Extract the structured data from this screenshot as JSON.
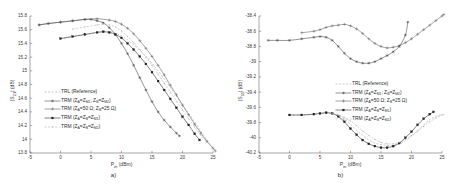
{
  "figure": {
    "panels": [
      {
        "caption": "a)",
        "ylabel": "|S21| (dB)",
        "xlabel": "Pin (dBm)"
      },
      {
        "caption": "b)",
        "ylabel": "|S11| (dB)",
        "xlabel": "Pin (dBm)"
      }
    ],
    "legend_entries": [
      {
        "label": "TRL (Reference)",
        "marker": "none",
        "color": "#9a9a9a",
        "dash": "2,1.6"
      },
      {
        "label": "TRM (ZA=ZM1;  ZB=ZM2)",
        "marker": "star",
        "color": "#3c3c3c",
        "dash": "0"
      },
      {
        "label": "TRM (ZA=50 Ω; ZB=25 Ω)",
        "marker": "plus",
        "color": "#5a5a5a",
        "dash": "0"
      },
      {
        "label": "TRM (ZA=ZB=ZM1)",
        "marker": "square",
        "color": "#1e1e1e",
        "dash": "0"
      },
      {
        "label": "TRM (ZA=ZB=ZM2)",
        "marker": "dot",
        "color": "#aaaaaa",
        "dash": "2,1.6"
      }
    ]
  },
  "chart_data": [
    {
      "type": "line",
      "title": "",
      "xlabel": "Pin (dBm)",
      "ylabel": "|S21| (dB)",
      "xlim": [
        -5,
        25
      ],
      "ylim": [
        13.8,
        15.8
      ],
      "xticks": [
        -5,
        0,
        5,
        10,
        15,
        20,
        25
      ],
      "yticks": [
        13.8,
        14,
        14.2,
        14.4,
        14.6,
        14.8,
        15,
        15.2,
        15.4,
        15.6,
        15.8
      ],
      "grid": false,
      "legend_position": "center-left",
      "series": [
        {
          "name": "TRL (Reference)",
          "x": [
            0,
            2,
            4,
            6,
            8,
            9,
            10,
            11,
            12,
            13,
            14,
            15,
            16,
            17,
            18,
            19,
            20,
            21,
            22,
            23,
            24,
            25,
            25.4
          ],
          "y": [
            15.47,
            15.5,
            15.53,
            15.56,
            15.57,
            15.55,
            15.51,
            15.45,
            15.38,
            15.3,
            15.21,
            15.11,
            15.0,
            14.88,
            14.76,
            14.63,
            14.5,
            14.38,
            14.25,
            14.12,
            13.99,
            13.87,
            13.82
          ]
        },
        {
          "name": "TRM (ZA=ZM1;  ZB=ZM2)",
          "x": [
            -3.5,
            -2,
            0,
            2,
            4,
            5,
            6,
            7,
            8,
            9,
            10,
            11,
            12,
            13,
            14,
            15,
            16,
            17,
            18,
            19,
            19.5
          ],
          "y": [
            15.67,
            15.69,
            15.71,
            15.73,
            15.75,
            15.75,
            15.73,
            15.7,
            15.63,
            15.53,
            15.4,
            15.25,
            15.08,
            14.9,
            14.72,
            14.55,
            14.4,
            14.28,
            14.18,
            14.09,
            14.05
          ]
        },
        {
          "name": "TRM (ZA=50 Ω; ZB=25 Ω)",
          "x": [
            -3.5,
            -2,
            0,
            2,
            4,
            6,
            8,
            9,
            10,
            11,
            12,
            13,
            14,
            15,
            16,
            17,
            18,
            19,
            20,
            21,
            22,
            23,
            24,
            25,
            25.4
          ],
          "y": [
            15.67,
            15.69,
            15.71,
            15.73,
            15.75,
            15.76,
            15.74,
            15.72,
            15.68,
            15.62,
            15.54,
            15.44,
            15.33,
            15.21,
            15.08,
            14.94,
            14.79,
            14.65,
            14.5,
            14.36,
            14.22,
            14.09,
            13.97,
            13.87,
            13.83
          ]
        },
        {
          "name": "TRM (ZA=ZB=ZM1)",
          "x": [
            0,
            2,
            4,
            6,
            7,
            8,
            9,
            10,
            11,
            12,
            13,
            14,
            15,
            16,
            17,
            18,
            19,
            20,
            21,
            22,
            22.8
          ],
          "y": [
            15.47,
            15.5,
            15.53,
            15.56,
            15.57,
            15.56,
            15.53,
            15.48,
            15.4,
            15.31,
            15.21,
            15.1,
            14.98,
            14.85,
            14.72,
            14.59,
            14.46,
            14.33,
            14.21,
            14.08,
            13.99
          ]
        },
        {
          "name": "TRM (ZA=ZB=ZM2)",
          "x": [
            2,
            4,
            6,
            7,
            8,
            9,
            10,
            11,
            12,
            13,
            14,
            15,
            16,
            17,
            18,
            19,
            20,
            21,
            22,
            23,
            24,
            25,
            25.4
          ],
          "y": [
            15.61,
            15.64,
            15.67,
            15.68,
            15.67,
            15.64,
            15.58,
            15.5,
            15.41,
            15.31,
            15.2,
            15.08,
            14.95,
            14.82,
            14.69,
            14.56,
            14.43,
            14.3,
            14.18,
            14.06,
            13.96,
            13.87,
            13.83
          ]
        }
      ]
    },
    {
      "type": "line",
      "title": "",
      "xlabel": "Pin (dBm)",
      "ylabel": "|S11| (dB)",
      "xlim": [
        -5,
        25
      ],
      "ylim": [
        -40.2,
        -38.4
      ],
      "xticks": [
        -5,
        0,
        5,
        10,
        15,
        20,
        25
      ],
      "yticks": [
        -40.2,
        -40,
        -39.8,
        -39.6,
        -39.4,
        -39.2,
        -39,
        -38.8,
        -38.6,
        -38.4
      ],
      "grid": false,
      "legend_position": "center-right",
      "series": [
        {
          "name": "TRL (Reference)",
          "x": [
            0,
            2,
            4,
            6,
            7,
            8,
            9,
            10,
            11,
            12,
            13,
            14,
            15,
            16,
            17,
            18,
            19,
            20,
            21,
            22,
            23,
            24,
            25
          ],
          "y": [
            -39.7,
            -39.7,
            -39.69,
            -39.68,
            -39.68,
            -39.7,
            -39.75,
            -39.82,
            -39.9,
            -39.97,
            -40.03,
            -40.07,
            -40.09,
            -40.1,
            -40.1,
            -40.08,
            -40.04,
            -39.98,
            -39.91,
            -39.83,
            -39.76,
            -39.72,
            -39.7
          ]
        },
        {
          "name": "TRM (ZA=ZM1;  ZB=ZM2)",
          "x": [
            -3.5,
            -2,
            0,
            2,
            4,
            5,
            6,
            7,
            8,
            9,
            10,
            11,
            12,
            13,
            14,
            15,
            16,
            17,
            18,
            19,
            19.4
          ],
          "y": [
            -38.72,
            -38.72,
            -38.72,
            -38.7,
            -38.68,
            -38.67,
            -38.68,
            -38.72,
            -38.8,
            -38.89,
            -38.96,
            -39.0,
            -39.02,
            -39.02,
            -39.0,
            -38.96,
            -38.92,
            -38.87,
            -38.8,
            -38.65,
            -38.48
          ]
        },
        {
          "name": "TRM (ZA=50 Ω; ZB=25 Ω)",
          "x": [
            2,
            4,
            5,
            6,
            7,
            8,
            9,
            10,
            11,
            12,
            13,
            14,
            15,
            16,
            17,
            18,
            19,
            20,
            21,
            22,
            23,
            24,
            25,
            25.3
          ],
          "y": [
            -38.62,
            -38.6,
            -38.58,
            -38.55,
            -38.53,
            -38.52,
            -38.51,
            -38.53,
            -38.57,
            -38.63,
            -38.7,
            -38.76,
            -38.8,
            -38.82,
            -38.81,
            -38.79,
            -38.75,
            -38.7,
            -38.64,
            -38.58,
            -38.52,
            -38.46,
            -38.4,
            -38.38
          ]
        },
        {
          "name": "TRM (ZA=ZB=ZM1)",
          "x": [
            0,
            2,
            4,
            5,
            6,
            7,
            8,
            9,
            10,
            11,
            12,
            13,
            14,
            15,
            16,
            17,
            18,
            19,
            20,
            21,
            22,
            23,
            23.6
          ],
          "y": [
            -39.7,
            -39.7,
            -39.69,
            -39.68,
            -39.67,
            -39.68,
            -39.72,
            -39.79,
            -39.88,
            -39.96,
            -40.03,
            -40.08,
            -40.11,
            -40.13,
            -40.13,
            -40.11,
            -40.07,
            -40.0,
            -39.92,
            -39.83,
            -39.75,
            -39.69,
            -39.66
          ]
        },
        {
          "name": "TRM (ZA=ZB=ZM2)",
          "x": [
            7,
            8,
            9,
            10,
            11,
            12,
            13,
            14,
            15,
            16,
            17,
            18,
            19,
            20,
            21,
            22,
            23,
            24,
            25,
            25.3
          ],
          "y": [
            -39.68,
            -39.7,
            -39.73,
            -39.78,
            -39.84,
            -39.91,
            -39.97,
            -40.02,
            -40.06,
            -40.08,
            -40.08,
            -40.06,
            -40.02,
            -39.97,
            -39.91,
            -39.85,
            -39.79,
            -39.74,
            -39.7,
            -39.69
          ]
        }
      ]
    }
  ]
}
